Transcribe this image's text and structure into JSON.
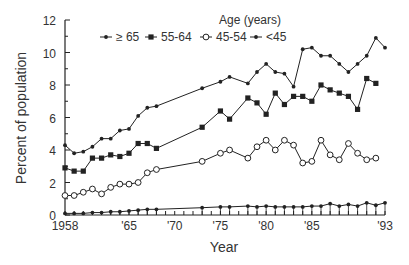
{
  "chart_data": {
    "type": "line",
    "title": "",
    "xlabel": "Year",
    "ylabel": "Percent of population",
    "xlim": [
      1958,
      1993
    ],
    "ylim": [
      0,
      12
    ],
    "grid": false,
    "legend_title": "Age (years)",
    "legend_position": "top",
    "x_tick_labels": [
      {
        "year": 1958,
        "label": "1958"
      },
      {
        "year": 1965,
        "label": "'65"
      },
      {
        "year": 1970,
        "label": "'70"
      },
      {
        "year": 1975,
        "label": "'75"
      },
      {
        "year": 1980,
        "label": "'80"
      },
      {
        "year": 1985,
        "label": "'85"
      },
      {
        "year": 1993,
        "label": "'93"
      }
    ],
    "y_ticks": [
      0,
      2,
      4,
      6,
      8,
      10,
      12
    ],
    "x": [
      1958,
      1959,
      1960,
      1961,
      1962,
      1963,
      1964,
      1965,
      1966,
      1967,
      1968,
      1973,
      1975,
      1976,
      1978,
      1979,
      1980,
      1981,
      1982,
      1983,
      1984,
      1985,
      1986,
      1987,
      1988,
      1989,
      1990,
      1991,
      1992,
      1993
    ],
    "series": [
      {
        "name": "≥ 65",
        "marker": "small-dot",
        "values": [
          4.3,
          3.8,
          3.9,
          4.2,
          4.7,
          4.7,
          5.2,
          5.3,
          6.1,
          6.6,
          6.7,
          7.8,
          8.2,
          8.5,
          8.1,
          8.8,
          9.3,
          8.8,
          8.7,
          7.9,
          10.2,
          10.3,
          9.8,
          9.8,
          9.3,
          8.8,
          9.3,
          9.8,
          10.9,
          10.3
        ]
      },
      {
        "name": "55-64",
        "marker": "filled-square",
        "values": [
          2.9,
          2.7,
          2.7,
          3.5,
          3.5,
          3.7,
          3.6,
          3.8,
          4.4,
          4.4,
          4.1,
          5.4,
          6.4,
          5.9,
          7.2,
          6.9,
          6.2,
          7.5,
          6.8,
          7.3,
          7.3,
          7.0,
          8.0,
          7.7,
          7.5,
          7.3,
          6.5,
          8.4,
          8.1,
          null
        ]
      },
      {
        "name": "45-54",
        "marker": "open-circle",
        "values": [
          1.2,
          1.2,
          1.4,
          1.6,
          1.3,
          1.7,
          1.9,
          1.9,
          2.0,
          2.6,
          2.8,
          3.3,
          3.8,
          4.0,
          3.5,
          4.2,
          4.6,
          4.0,
          4.6,
          4.3,
          3.2,
          3.3,
          4.6,
          3.7,
          3.4,
          4.4,
          3.8,
          3.4,
          3.5,
          null
        ]
      },
      {
        "name": "<45",
        "marker": "small-dot",
        "values": [
          0.1,
          0.1,
          0.1,
          0.15,
          0.15,
          0.2,
          0.2,
          0.25,
          0.3,
          0.35,
          0.35,
          0.45,
          0.5,
          0.5,
          0.55,
          0.5,
          0.55,
          0.5,
          0.5,
          0.5,
          0.5,
          0.55,
          0.55,
          0.7,
          0.55,
          0.65,
          0.55,
          0.75,
          0.6,
          0.75
        ]
      }
    ]
  },
  "colors": {
    "line": "#222222",
    "axis": "#333333",
    "text": "#333333"
  }
}
